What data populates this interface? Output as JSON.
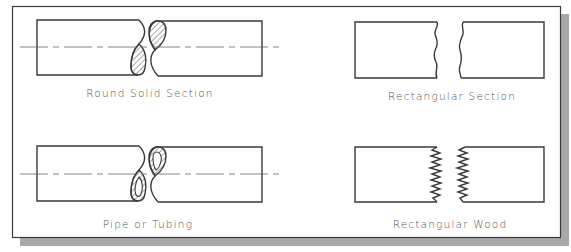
{
  "figure": {
    "colors": {
      "background": "#ffffff",
      "line": "#3a3a3a",
      "shadow": "#a8a8a8",
      "label": "#555555",
      "centerline": "#666666"
    },
    "panels": [
      {
        "id": "round-solid",
        "label": "Round Solid Section"
      },
      {
        "id": "rectangular",
        "label": "Rectangular Section"
      },
      {
        "id": "pipe",
        "label": "Pipe or Tubing"
      },
      {
        "id": "rect-wood",
        "label": "Rectangular Wood"
      }
    ]
  }
}
